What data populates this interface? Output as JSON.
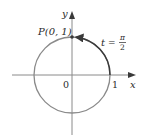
{
  "diagram": {
    "type": "unit-circle",
    "center": [
      72,
      75
    ],
    "radius": 38,
    "colors": {
      "circle": "#8a8a8a",
      "axis": "#8a8a8a",
      "arc": "#3a3a3a",
      "text": "#2a2a2a"
    },
    "axes": {
      "x_label": "x",
      "y_label": "y"
    },
    "labels": {
      "origin": "0",
      "one": "1",
      "point": "P(0, 1)",
      "t_var": "t",
      "t_eq": "=",
      "t_num": "π",
      "t_den": "2"
    }
  }
}
